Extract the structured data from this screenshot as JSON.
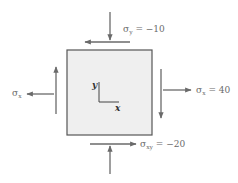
{
  "colors": {
    "element_fill": "#efefef",
    "element_border": "#555555",
    "arrow": "#6a6a6a",
    "axes": "#444444",
    "label_text": "#6b6b6b"
  },
  "element": {
    "description": "stress element"
  },
  "axes": {
    "x_label": "x",
    "y_label": "y"
  },
  "labels": {
    "sigma_y": {
      "symbol": "σ",
      "subscript": "y",
      "value_text": " = −10"
    },
    "sigma_x_left": {
      "symbol": "σ",
      "subscript": "x",
      "value_text": ""
    },
    "sigma_x_right": {
      "symbol": "σ",
      "subscript": "x",
      "value_text": " = 40"
    },
    "tau_xy": {
      "symbol": "σ",
      "subscript": "xy",
      "value_text": " = −20"
    }
  },
  "stresses": {
    "sigma_x": 40,
    "sigma_y": -10,
    "tau_xy": -20
  },
  "icons": {
    "arrows": [
      "arrow-down-icon",
      "arrow-left-icon",
      "arrow-up-icon",
      "arrow-right-icon"
    ]
  }
}
